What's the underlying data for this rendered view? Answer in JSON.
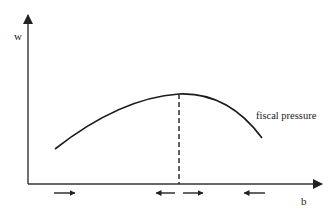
{
  "diagram": {
    "y_axis_label": "w",
    "x_axis_label": "b",
    "curve_label": "fiscal pressure",
    "peak_marker": "dashed vertical line at curve maximum",
    "direction_arrows": [
      "right",
      "left",
      "right",
      "left"
    ],
    "colors": {
      "line": "#1a1a1a",
      "axis": "#333333",
      "background": "#ffffff"
    }
  }
}
